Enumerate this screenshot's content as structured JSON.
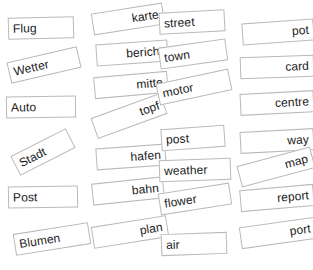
{
  "exercise": {
    "type": "word-matching-cards",
    "background_color": "#ffffff",
    "card_background": "#ffffff",
    "card_border_color": "#b9b9b9",
    "text_color": "#1a1a1a"
  },
  "cards": [
    {
      "id": "flug",
      "label": "Flug",
      "language": "de",
      "align": "left",
      "x": 8,
      "y": 17,
      "w": 66,
      "h": 22,
      "rot": -1.5,
      "clip": false
    },
    {
      "id": "wetter",
      "label": "Wetter",
      "language": "de",
      "align": "left",
      "x": 8,
      "y": 54,
      "w": 72,
      "h": 22,
      "rot": -13,
      "clip": false
    },
    {
      "id": "auto",
      "label": "Auto",
      "language": "de",
      "align": "left",
      "x": 6,
      "y": 96,
      "w": 70,
      "h": 22,
      "rot": -1,
      "clip": false
    },
    {
      "id": "stadt",
      "label": "Stadt",
      "language": "de",
      "align": "left",
      "x": 12,
      "y": 141,
      "w": 62,
      "h": 22,
      "rot": -27,
      "clip": true
    },
    {
      "id": "post_de",
      "label": "Post",
      "language": "de",
      "align": "left",
      "x": 8,
      "y": 186,
      "w": 70,
      "h": 22,
      "rot": -1,
      "clip": false
    },
    {
      "id": "blumen",
      "label": "Blumen",
      "language": "de",
      "align": "left",
      "x": 14,
      "y": 228,
      "w": 76,
      "h": 22,
      "rot": -9,
      "clip": false
    },
    {
      "id": "karte",
      "label": "karte",
      "language": "de",
      "align": "right",
      "x": 92,
      "y": 8,
      "w": 72,
      "h": 22,
      "rot": -9,
      "clip": false
    },
    {
      "id": "bericht",
      "label": "bericht",
      "language": "de",
      "align": "right",
      "x": 96,
      "y": 42,
      "w": 72,
      "h": 22,
      "rot": -4,
      "clip": false
    },
    {
      "id": "mitte",
      "label": "mitte",
      "language": "de",
      "align": "right",
      "x": 94,
      "y": 74,
      "w": 74,
      "h": 22,
      "rot": -5,
      "clip": false
    },
    {
      "id": "topf",
      "label": "topf",
      "language": "de",
      "align": "right",
      "x": 92,
      "y": 105,
      "w": 74,
      "h": 22,
      "rot": -20,
      "clip": false
    },
    {
      "id": "hafen",
      "label": "hafen",
      "language": "de",
      "align": "right",
      "x": 96,
      "y": 146,
      "w": 70,
      "h": 22,
      "rot": -4,
      "clip": false
    },
    {
      "id": "bahn",
      "label": "bahn",
      "language": "de",
      "align": "right",
      "x": 92,
      "y": 180,
      "w": 72,
      "h": 22,
      "rot": -6,
      "clip": false
    },
    {
      "id": "plan",
      "label": "plan",
      "language": "de",
      "align": "right",
      "x": 92,
      "y": 221,
      "w": 76,
      "h": 22,
      "rot": -9,
      "clip": false
    },
    {
      "id": "street",
      "label": "street",
      "language": "en",
      "align": "left",
      "x": 159,
      "y": 11,
      "w": 66,
      "h": 22,
      "rot": -3,
      "clip": false
    },
    {
      "id": "town",
      "label": "town",
      "language": "en",
      "align": "left",
      "x": 159,
      "y": 43,
      "w": 68,
      "h": 22,
      "rot": -8,
      "clip": false
    },
    {
      "id": "motor",
      "label": "motor",
      "language": "en",
      "align": "left",
      "x": 157,
      "y": 76,
      "w": 74,
      "h": 22,
      "rot": -12,
      "clip": false
    },
    {
      "id": "post_en",
      "label": "post",
      "language": "en",
      "align": "left",
      "x": 161,
      "y": 127,
      "w": 64,
      "h": 22,
      "rot": -4,
      "clip": false
    },
    {
      "id": "weather",
      "label": "weather",
      "language": "en",
      "align": "left",
      "x": 159,
      "y": 159,
      "w": 72,
      "h": 22,
      "rot": -2,
      "clip": false
    },
    {
      "id": "flower",
      "label": "flower",
      "language": "en",
      "align": "left",
      "x": 159,
      "y": 188,
      "w": 72,
      "h": 22,
      "rot": -9,
      "clip": false
    },
    {
      "id": "air",
      "label": "air",
      "language": "en",
      "align": "left",
      "x": 161,
      "y": 233,
      "w": 66,
      "h": 22,
      "rot": -2,
      "clip": false
    },
    {
      "id": "pot",
      "label": "pot",
      "language": "en",
      "align": "right",
      "x": 242,
      "y": 21,
      "w": 72,
      "h": 22,
      "rot": -4,
      "clip": false
    },
    {
      "id": "card",
      "label": "card",
      "language": "en",
      "align": "right",
      "x": 240,
      "y": 56,
      "w": 74,
      "h": 22,
      "rot": -2,
      "clip": false
    },
    {
      "id": "centre",
      "label": "centre",
      "language": "en",
      "align": "right",
      "x": 240,
      "y": 92,
      "w": 74,
      "h": 22,
      "rot": -3,
      "clip": false
    },
    {
      "id": "way",
      "label": "way",
      "language": "en",
      "align": "right",
      "x": 240,
      "y": 130,
      "w": 74,
      "h": 22,
      "rot": -3,
      "clip": false
    },
    {
      "id": "map",
      "label": "map",
      "language": "en",
      "align": "right",
      "x": 238,
      "y": 156,
      "w": 76,
      "h": 22,
      "rot": -15,
      "clip": false
    },
    {
      "id": "report",
      "label": "report",
      "language": "en",
      "align": "right",
      "x": 240,
      "y": 187,
      "w": 74,
      "h": 22,
      "rot": -5,
      "clip": true
    },
    {
      "id": "port",
      "label": "port",
      "language": "en",
      "align": "right",
      "x": 240,
      "y": 222,
      "w": 76,
      "h": 22,
      "rot": -8,
      "clip": false
    }
  ]
}
